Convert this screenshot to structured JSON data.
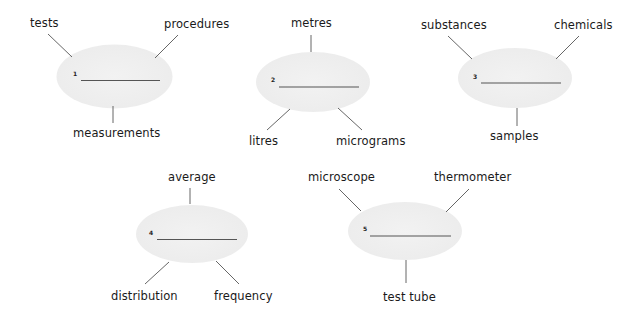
{
  "exercise": {
    "items": [
      {
        "number": "1",
        "answer_blank": "",
        "words": [
          "tests",
          "procedures",
          "measurements"
        ]
      },
      {
        "number": "2",
        "answer_blank": "",
        "words": [
          "metres",
          "litres",
          "micrograms"
        ]
      },
      {
        "number": "3",
        "answer_blank": "",
        "words": [
          "substances",
          "chemicals",
          "samples"
        ]
      },
      {
        "number": "4",
        "answer_blank": "",
        "words": [
          "average",
          "distribution",
          "frequency"
        ]
      },
      {
        "number": "5",
        "answer_blank": "",
        "words": [
          "microscope",
          "thermometer",
          "test tube"
        ]
      }
    ]
  },
  "colors": {
    "bubble_fill": "#eeeeee",
    "line": "#555555",
    "text": "#1a1a1a"
  }
}
